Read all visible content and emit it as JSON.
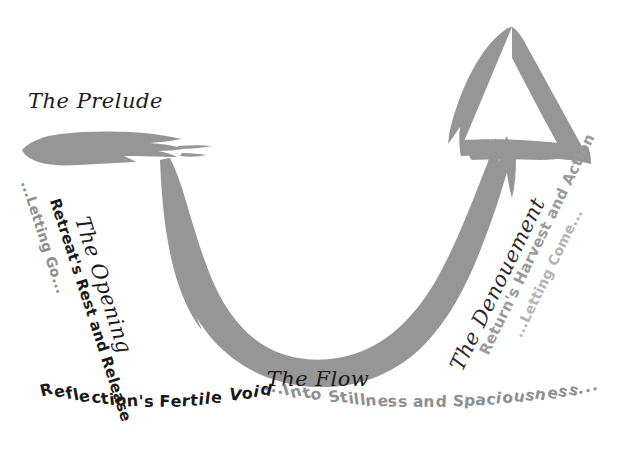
{
  "diagram": {
    "background_color": "#ffffff",
    "brush_color": "#969696",
    "ink_color": "#1a1a1a",
    "muted_color": "#8f8f8f"
  },
  "stages": {
    "prelude": {
      "title": "The Prelude",
      "shape_name": "prelude-brushstroke"
    },
    "opening": {
      "title": "The Opening",
      "subtitle": "Retreat's Rest and Release",
      "tagline": "...Letting Go..."
    },
    "flow": {
      "title": "The Flow",
      "subtitle": "Reflection's Fertile Void",
      "tagline": "...Into Stillness and Spaciousness..."
    },
    "denouement": {
      "title": "The Denouement",
      "subtitle": "Return's Harvest and Action",
      "tagline": "...Letting Come...",
      "shape_name": "delta-triangle"
    }
  }
}
